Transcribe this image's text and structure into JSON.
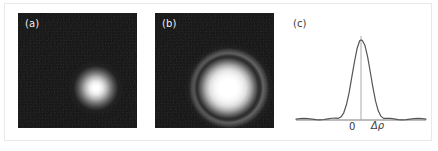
{
  "figure": {
    "background_color": "#ffffff",
    "frame_color": "#e9e9e9",
    "width": 438,
    "height": 151
  },
  "panels": [
    {
      "id": "a",
      "label": "(a)",
      "type": "intensity-image",
      "description": "dark noisy field with a single bright gaussian spot slightly right of center",
      "background_color": "#0c0c0c",
      "spot_color": "#ffffff"
    },
    {
      "id": "b",
      "label": "(b)",
      "type": "intensity-image",
      "description": "dark noisy field with a bright central disk surrounded by a dark gap and a grey diffraction halo ring",
      "background_color": "#0c0c0c",
      "spot_color": "#ffffff",
      "ring_color": "#767676"
    },
    {
      "id": "c",
      "label": "(c)",
      "type": "line-plot",
      "line_color": "#555555",
      "axis_color": "#7a7a7a"
    }
  ],
  "chart_data": {
    "type": "line",
    "title": "",
    "xlabel": "Δρ",
    "ylabel": "",
    "grid": false,
    "legend": null,
    "xtick_labels": [
      "0"
    ],
    "xtick_values": [
      0
    ],
    "annotations": [
      {
        "text": "0",
        "x": 0,
        "y": 0,
        "role": "origin-tick-label"
      },
      {
        "text": "Δρ",
        "x": 1.0,
        "y": 0,
        "role": "x-axis-label"
      }
    ],
    "xlim": [
      -2.45,
      2.45
    ],
    "ylim": [
      -0.06,
      1.08
    ],
    "vertical_marker_x": 0,
    "series": [
      {
        "name": "point-spread-function",
        "comment": "squared sinc / Airy-like profile, central lobe plus small side lobes",
        "x": [
          -2.45,
          -2.3,
          -2.15,
          -2.0,
          -1.85,
          -1.7,
          -1.55,
          -1.4,
          -1.25,
          -1.1,
          -0.95,
          -0.85,
          -0.75,
          -0.65,
          -0.55,
          -0.45,
          -0.35,
          -0.25,
          -0.15,
          -0.05,
          0.0,
          0.05,
          0.15,
          0.25,
          0.35,
          0.45,
          0.55,
          0.65,
          0.75,
          0.85,
          0.95,
          1.1,
          1.25,
          1.4,
          1.55,
          1.7,
          1.85,
          2.0,
          2.15,
          2.3,
          2.45
        ],
        "y": [
          0.01,
          0.016,
          0.02,
          0.018,
          0.011,
          0.004,
          0.002,
          0.006,
          0.014,
          0.022,
          0.024,
          0.021,
          0.04,
          0.09,
          0.19,
          0.34,
          0.53,
          0.72,
          0.89,
          0.99,
          1.0,
          0.995,
          0.93,
          0.79,
          0.6,
          0.405,
          0.235,
          0.115,
          0.048,
          0.02,
          0.022,
          0.02,
          0.013,
          0.005,
          0.002,
          0.004,
          0.011,
          0.018,
          0.02,
          0.016,
          0.01
        ]
      }
    ]
  }
}
